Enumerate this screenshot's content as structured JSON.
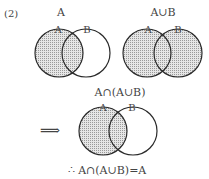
{
  "problem_label": "(2)",
  "diagrams": [
    {
      "title": "A",
      "label_a": "A",
      "label_b": "B",
      "shaded": "A"
    },
    {
      "title": "A∪B",
      "label_a": "A",
      "label_b": "B",
      "shaded": "A∪B"
    },
    {
      "title": "A∩(A∪B)",
      "label_a": "A",
      "label_b": "B",
      "shaded": "A"
    }
  ],
  "arrow_symbol": "⟹",
  "conclusion": "∴ A∩(A∪B)=A",
  "colors": {
    "shade": "#c8c8c8",
    "stroke": "#2a2a2a"
  }
}
